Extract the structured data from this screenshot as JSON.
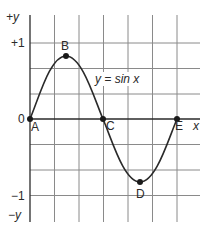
{
  "figure": {
    "type": "sine-wave-diagram",
    "equation_label": "y = sin x",
    "axis_labels": {
      "y_positive": "+y",
      "y_negative": "−y",
      "x": "x"
    },
    "tick_labels": {
      "plus_one": "+1",
      "zero": "0",
      "minus_one": "−1"
    },
    "points": [
      {
        "label": "A",
        "x": 30,
        "y": 119,
        "desc": "origin, sin 0 = 0"
      },
      {
        "label": "B",
        "x": 66,
        "y": 56,
        "desc": "maximum"
      },
      {
        "label": "C",
        "x": 103,
        "y": 119,
        "desc": "zero crossing"
      },
      {
        "label": "D",
        "x": 140,
        "y": 182,
        "desc": "minimum"
      },
      {
        "label": "E",
        "x": 177,
        "y": 119,
        "desc": "zero crossing, full period"
      }
    ],
    "colors": {
      "grid": "#8a8a8a",
      "axis": "#2a2a2a",
      "curve": "#2a2a2a",
      "text": "#2a2a2a",
      "background": "#ffffff"
    }
  }
}
